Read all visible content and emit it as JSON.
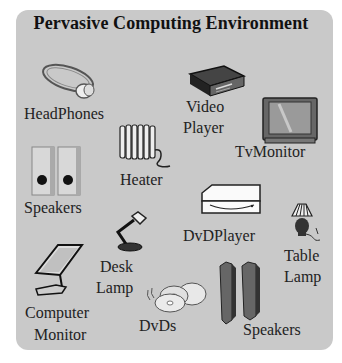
{
  "title": "Pervasive Computing Environment",
  "colors": {
    "panel": "#c9c9c9",
    "text": "#222222",
    "background": "#ffffff"
  },
  "devices": [
    {
      "name": "headphones",
      "icon": "headphones-icon",
      "label": [
        "HeadPhones"
      ]
    },
    {
      "name": "video-player",
      "icon": "video-player-icon",
      "label": [
        "Video",
        "Player"
      ]
    },
    {
      "name": "tv-monitor",
      "icon": "tv-icon",
      "label": [
        "TvMonitor"
      ]
    },
    {
      "name": "heater",
      "icon": "heater-icon",
      "label": [
        "Heater"
      ]
    },
    {
      "name": "speakers-left",
      "icon": "speakers-icon",
      "label": [
        "Speakers"
      ]
    },
    {
      "name": "dvd-player",
      "icon": "dvd-player-icon",
      "label": [
        "DvDPlayer"
      ]
    },
    {
      "name": "table-lamp",
      "icon": "table-lamp-icon",
      "label": [
        "Table",
        "Lamp"
      ]
    },
    {
      "name": "desk-lamp",
      "icon": "desk-lamp-icon",
      "label": [
        "Desk",
        "Lamp"
      ]
    },
    {
      "name": "computer-monitor",
      "icon": "monitor-icon",
      "label": [
        "Computer",
        "Monitor"
      ]
    },
    {
      "name": "dvds",
      "icon": "dvd-discs-icon",
      "label": [
        "DvDs"
      ]
    },
    {
      "name": "speakers-right",
      "icon": "tower-speakers-icon",
      "label": [
        "Speakers"
      ]
    }
  ]
}
